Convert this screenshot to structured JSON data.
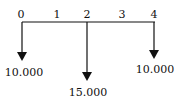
{
  "diagram": {
    "type": "cash-flow",
    "periods": [
      "0",
      "1",
      "2",
      "3",
      "4"
    ],
    "flows": [
      {
        "period": "0",
        "direction": "down",
        "amount": "10.000"
      },
      {
        "period": "2",
        "direction": "down",
        "amount": "15.000"
      },
      {
        "period": "4",
        "direction": "down",
        "amount": "10.000"
      }
    ],
    "color": "#111111"
  }
}
